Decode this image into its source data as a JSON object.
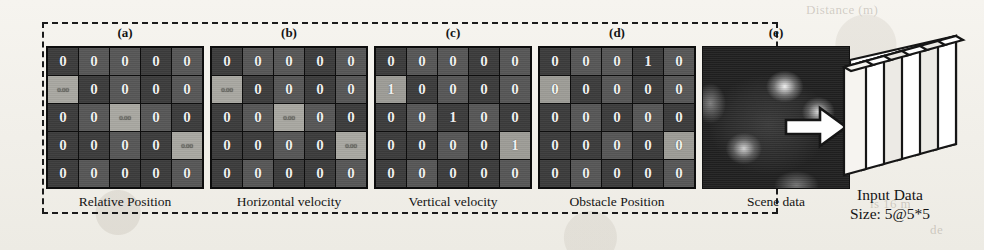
{
  "figure": {
    "panel_tags": [
      "(a)",
      "(b)",
      "(c)",
      "(d)",
      "(e)"
    ],
    "captions": [
      "Relative Position",
      "Horizontal velocity",
      "Vertical velocity",
      "Obstacle Position",
      "Scene data"
    ],
    "arrow": "right-block-arrow",
    "output": {
      "title": "Input Data",
      "size": "Size: 5@5*5",
      "plate_count": 5
    },
    "colors": {
      "paper": "#f3f1ec",
      "grid_line": "#0d0d0d",
      "cell_dark": "#4a4a4a",
      "cell_light": "#a9a8a2",
      "ink": "#141414"
    }
  },
  "chart_data": {
    "type": "heatmap",
    "title": "Input Data Size: 5@5*5",
    "xlabel": "",
    "ylabel": "",
    "grid": true,
    "legend": "none",
    "panels": [
      {
        "tag": "(a)",
        "caption": "Relative Position",
        "rows": 5,
        "cols": 5,
        "values": [
          [
            "0",
            "0",
            "0",
            "0",
            "0"
          ],
          [
            "0.00",
            "0",
            "0",
            "0",
            "0"
          ],
          [
            "0",
            "0",
            "0.00",
            "0",
            "0"
          ],
          [
            "0",
            "0",
            "0",
            "0",
            "0.00"
          ],
          [
            "0",
            "0",
            "0",
            "0",
            "0"
          ]
        ],
        "highlighted_cells": [
          [
            1,
            0
          ],
          [
            2,
            2
          ],
          [
            3,
            4
          ]
        ]
      },
      {
        "tag": "(b)",
        "caption": "Horizontal velocity",
        "rows": 5,
        "cols": 5,
        "values": [
          [
            "0",
            "0",
            "0",
            "0",
            "0"
          ],
          [
            "0.00",
            "0",
            "0",
            "0",
            "0"
          ],
          [
            "0",
            "0",
            "0.00",
            "0",
            "0"
          ],
          [
            "0",
            "0",
            "0",
            "0",
            "0.00"
          ],
          [
            "0",
            "0",
            "0",
            "0",
            "0"
          ]
        ],
        "highlighted_cells": [
          [
            1,
            0
          ],
          [
            2,
            2
          ],
          [
            3,
            4
          ]
        ]
      },
      {
        "tag": "(c)",
        "caption": "Vertical velocity",
        "rows": 5,
        "cols": 5,
        "values": [
          [
            "0",
            "0",
            "0",
            "0",
            "0"
          ],
          [
            "1",
            "0",
            "0",
            "0",
            "0"
          ],
          [
            "0",
            "0",
            "1",
            "0",
            "0"
          ],
          [
            "0",
            "0",
            "0",
            "0",
            "1"
          ],
          [
            "0",
            "0",
            "0",
            "0",
            "0"
          ]
        ],
        "highlighted_cells": [
          [
            1,
            0
          ],
          [
            3,
            4
          ]
        ]
      },
      {
        "tag": "(d)",
        "caption": "Obstacle Position",
        "rows": 5,
        "cols": 5,
        "values": [
          [
            "0",
            "0",
            "0",
            "1",
            "0"
          ],
          [
            "0",
            "0",
            "0",
            "0",
            "0"
          ],
          [
            "0",
            "0",
            "0",
            "0",
            "0"
          ],
          [
            "0",
            "0",
            "0",
            "0",
            "0"
          ],
          [
            "0",
            "0",
            "0",
            "0",
            "0"
          ]
        ],
        "highlighted_cells": [
          [
            1,
            0
          ],
          [
            3,
            4
          ]
        ]
      },
      {
        "tag": "(e)",
        "caption": "Scene data",
        "rows": 0,
        "cols": 0,
        "values": [],
        "highlighted_cells": [],
        "render": "grayscale-blob-image"
      }
    ]
  },
  "background_text": [
    "Distance (m)",
    "moving",
    "the",
    "is 16 m",
    "de"
  ]
}
